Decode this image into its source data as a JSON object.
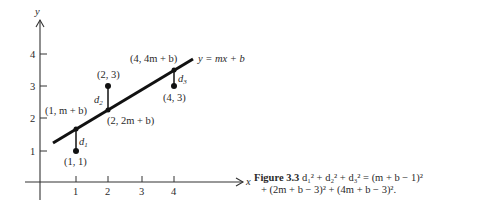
{
  "figure": {
    "axes": {
      "x_label": "x",
      "y_label": "y",
      "x_ticks": [
        "1",
        "2",
        "3",
        "4"
      ],
      "y_ticks": [
        "1",
        "2",
        "3",
        "4"
      ]
    },
    "line_label": "y = mx + b",
    "data_points": [
      {
        "label": "(1, 1)",
        "x": 1,
        "y": 1
      },
      {
        "label": "(2, 3)",
        "x": 2,
        "y": 3
      },
      {
        "label": "(4, 3)",
        "x": 4,
        "y": 3
      }
    ],
    "line_points": [
      {
        "label": "(1, m + b)"
      },
      {
        "label": "(2, 2m + b)"
      },
      {
        "label": "(4, 4m + b)"
      }
    ],
    "distances": [
      "d1",
      "d2",
      "d3"
    ]
  },
  "caption": {
    "figure_number": "Figure 3.3",
    "line1": "d₁² + d₂² + d₃² = (m + b − 1)²",
    "line2": "+ (2m + b − 3)² + (4m + b − 3)²."
  }
}
